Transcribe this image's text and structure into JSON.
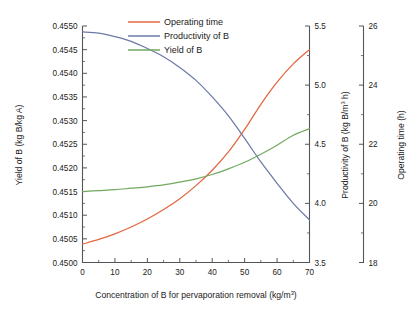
{
  "chart_data": {
    "type": "line",
    "title": "",
    "xlabel": "Concentration of B for pervaporation removal (kg/m³)",
    "xlabel_base": "Concentration of B for pervaporation removal (kg/m",
    "xlabel_sup": "3",
    "xlabel_tail": ")",
    "x": [
      0,
      5,
      10,
      15,
      20,
      25,
      30,
      35,
      40,
      45,
      50,
      55,
      60,
      65,
      70
    ],
    "xlim": [
      0,
      70
    ],
    "xticks": [
      0,
      10,
      20,
      30,
      40,
      50,
      60,
      70
    ],
    "xticklabels": [
      "0",
      "10",
      "20",
      "30",
      "40",
      "50",
      "60",
      "70"
    ],
    "grid": false,
    "legend_position": "top-center",
    "axes": [
      {
        "id": "left",
        "name": "yield-axis",
        "label": "Yield of B (kg B/kg A)",
        "units": "kg B/kg A",
        "lim": [
          0.45,
          0.455
        ],
        "ticks": [
          0.45,
          0.4505,
          0.451,
          0.4515,
          0.452,
          0.4525,
          0.453,
          0.4535,
          0.454,
          0.4545,
          0.455
        ],
        "ticklabels": [
          "0.4500",
          "0.4505",
          "0.4510",
          "0.4515",
          "0.4520",
          "0.4525",
          "0.4530",
          "0.4535",
          "0.4540",
          "0.4545",
          "0.4550"
        ]
      },
      {
        "id": "right1",
        "name": "productivity-axis",
        "label": "Productivity of B (kg B/m³ h)",
        "label_base": "Productivity of B (kg B/m",
        "label_sup": "3",
        "label_tail": " h)",
        "units": "kg B/m³ h",
        "lim": [
          3.5,
          5.5
        ],
        "ticks": [
          3.5,
          4.0,
          4.5,
          5.0,
          5.5
        ],
        "ticklabels": [
          "3.5",
          "4.0",
          "4.5",
          "5.0",
          "5.5"
        ]
      },
      {
        "id": "right2",
        "name": "operating-time-axis",
        "label": "Operating time (h)",
        "units": "h",
        "lim": [
          18,
          26
        ],
        "ticks": [
          18,
          20,
          22,
          24,
          26
        ],
        "ticklabels": [
          "18",
          "20",
          "22",
          "24",
          "26"
        ]
      }
    ],
    "series": [
      {
        "name": "Operating time",
        "axis": "right2",
        "color": "#E2663F",
        "values": [
          18.62,
          18.78,
          18.97,
          19.2,
          19.47,
          19.79,
          20.16,
          20.6,
          21.12,
          21.74,
          22.5,
          23.35,
          24.1,
          24.72,
          25.2
        ]
      },
      {
        "name": "Productivity of B",
        "axis": "right1",
        "color": "#6C7AA8",
        "values": [
          5.45,
          5.44,
          5.41,
          5.37,
          5.31,
          5.24,
          5.15,
          5.04,
          4.9,
          4.74,
          4.55,
          4.35,
          4.17,
          4.0,
          3.86
        ]
      },
      {
        "name": "Yield of B",
        "axis": "left",
        "color": "#71A95F",
        "values": [
          0.4515,
          0.45152,
          0.45154,
          0.45157,
          0.4516,
          0.45164,
          0.4517,
          0.45177,
          0.45186,
          0.45198,
          0.45212,
          0.45229,
          0.45248,
          0.45269,
          0.45283
        ]
      }
    ],
    "legend": [
      {
        "label": "Operating time",
        "color": "#E2663F"
      },
      {
        "label": "Productivity of B",
        "color": "#6C7AA8"
      },
      {
        "label": "Yield of B",
        "color": "#71A95F"
      }
    ]
  }
}
